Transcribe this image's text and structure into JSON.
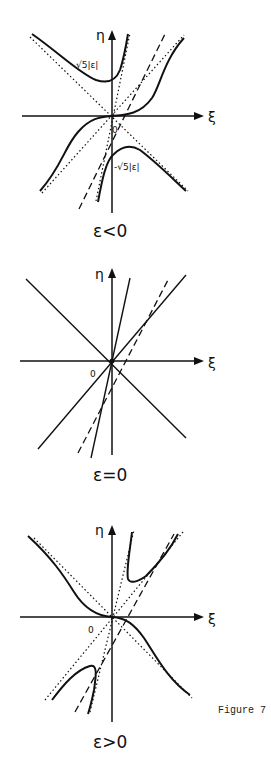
{
  "figure": {
    "label": "Figure 7",
    "axes": {
      "x_label": "ξ",
      "y_label": "η",
      "origin_label": "0"
    },
    "panels": [
      {
        "id": "eps-negative",
        "caption": "ε<0",
        "annotations": {
          "upper": "√5|ε|",
          "lower": "-√5|ε|"
        },
        "curves": "solid S-curve through origin, two solid hyperbola-like branches above/below; dotted asymptotes; dashed line"
      },
      {
        "id": "eps-zero",
        "caption": "ε=0",
        "curves": "four straight solid lines through origin plus a dashed line"
      },
      {
        "id": "eps-positive",
        "caption": "ε>0",
        "curves": "solid decreasing curve through origin, two solid branches in upper-right and lower-left; dotted asymptotes; dashed line"
      }
    ]
  }
}
